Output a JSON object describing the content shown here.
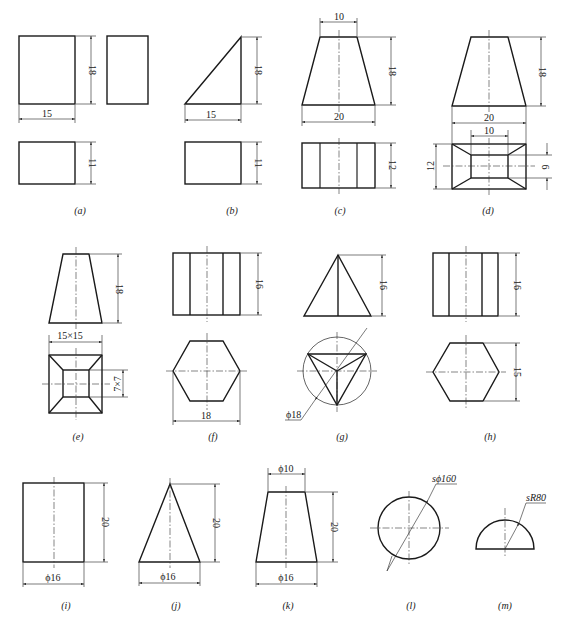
{
  "figures": [
    {
      "id": "a",
      "caption": "(a)",
      "dims": {
        "width": "15",
        "height": "18",
        "depth": "11"
      }
    },
    {
      "id": "b",
      "caption": "(b)",
      "dims": {
        "width": "15",
        "height": "18",
        "depth": "11"
      }
    },
    {
      "id": "c",
      "caption": "(c)",
      "dims": {
        "top": "10",
        "bottom": "20",
        "height": "18",
        "depth": "12"
      }
    },
    {
      "id": "d",
      "caption": "(d)",
      "dims": {
        "bottom": "20",
        "top": "10",
        "height": "18",
        "depth": "12",
        "top_depth": "6"
      }
    },
    {
      "id": "e",
      "caption": "(e)",
      "dims": {
        "height": "18",
        "bottom": "15×15",
        "top": "7×7"
      }
    },
    {
      "id": "f",
      "caption": "(f)",
      "dims": {
        "height": "16",
        "across": "18"
      }
    },
    {
      "id": "g",
      "caption": "(g)",
      "dims": {
        "height": "16",
        "diameter": "ϕ18"
      }
    },
    {
      "id": "h",
      "caption": "(h)",
      "dims": {
        "height": "16",
        "across_flats": "15"
      }
    },
    {
      "id": "i",
      "caption": "(i)",
      "dims": {
        "height": "20",
        "diameter": "ϕ16"
      }
    },
    {
      "id": "j",
      "caption": "(j)",
      "dims": {
        "height": "20",
        "diameter": "ϕ16"
      }
    },
    {
      "id": "k",
      "caption": "(k)",
      "dims": {
        "top": "ϕ10",
        "height": "20",
        "bottom": "ϕ16"
      }
    },
    {
      "id": "l",
      "caption": "(l)",
      "dims": {
        "diameter": "sϕ160"
      }
    },
    {
      "id": "m",
      "caption": "(m)",
      "dims": {
        "radius": "sR80"
      }
    }
  ],
  "colors": {
    "line": "#1a1a1a",
    "background": "#ffffff"
  }
}
